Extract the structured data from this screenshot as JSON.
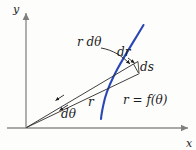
{
  "figure": {
    "caption_present": false,
    "colors": {
      "curve": "#2b47b5",
      "axis": "#8d8d8d",
      "line": "#2a2a2a",
      "text": "#1c1c1c",
      "background": "#fdfdfc"
    },
    "axes": {
      "y_label": "y",
      "x_label": "x",
      "origin": {
        "x": 26,
        "y": 128
      },
      "x_end": {
        "x": 190,
        "y": 128
      },
      "y_end": {
        "x": 26,
        "y": 11
      }
    },
    "labels": {
      "r_dtheta": "r dθ",
      "dr": "dr",
      "ds": "ds",
      "r": "r",
      "dtheta": "dθ",
      "polar_equation": "r = f(θ)"
    },
    "curve": {
      "name": "polar-curve",
      "start": {
        "x": 143,
        "y": 25
      },
      "end": {
        "x": 101,
        "y": 119
      }
    },
    "rays": [
      {
        "name": "outer-ray",
        "from": {
          "x": 26,
          "y": 128
        },
        "to": {
          "x": 133,
          "y": 64
        }
      },
      {
        "name": "inner-ray",
        "from": {
          "x": 26,
          "y": 128
        },
        "to": {
          "x": 139,
          "y": 73
        }
      }
    ],
    "differential_triangle": {
      "vertices": [
        {
          "x": 133,
          "y": 64
        },
        {
          "x": 137,
          "y": 62
        },
        {
          "x": 139,
          "y": 73
        }
      ]
    }
  }
}
